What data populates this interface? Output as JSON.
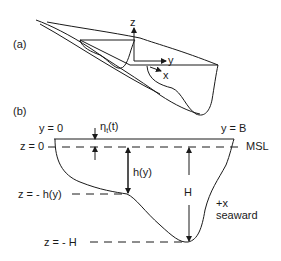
{
  "panel_a": {
    "label": "(a)",
    "axes": {
      "z": "z",
      "y": "y",
      "x": "x"
    }
  },
  "panel_b": {
    "label": "(b)",
    "top_left": "y = 0",
    "top_right": "y = B",
    "eta": "η",
    "eta_sub": "t",
    "eta_arg": "(t)",
    "msl": "MSL",
    "z0": "z = 0",
    "zh": "z = - h(y)",
    "zH": "z = - H",
    "h_label": "h(y)",
    "H_label": "H",
    "plus_x": "+x",
    "seaward": "seaward"
  },
  "colors": {
    "ink": "#1a1a1a",
    "background": "#ffffff"
  }
}
